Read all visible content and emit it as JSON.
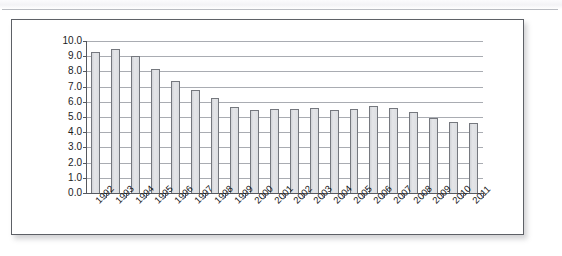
{
  "page": {
    "background_color": "#ffffff",
    "card_border_color": "#5d6066",
    "scan_band_color": "#f3f3f6"
  },
  "chart_style": {
    "bar_fill": "#dedfe3",
    "bar_border": "#75787e",
    "gridline_color": "#a9acb2",
    "axis_color": "#55585e",
    "text_color": "#17181a"
  },
  "chart_data": {
    "type": "bar",
    "title": "",
    "xlabel": "",
    "ylabel": "",
    "ylim": [
      0.0,
      10.0
    ],
    "ytick_step": 1.0,
    "ytick_labels": [
      "10.0",
      "9.0",
      "8.0",
      "7.0",
      "6.0",
      "5.0",
      "4.0",
      "3.0",
      "2.0",
      "1.0",
      "0.0"
    ],
    "ytick_values": [
      10.0,
      9.0,
      8.0,
      7.0,
      6.0,
      5.0,
      4.0,
      3.0,
      2.0,
      1.0,
      0.0
    ],
    "grid": true,
    "legend": false,
    "legend_position": "none",
    "categories": [
      "1992",
      "1993",
      "1994",
      "1995",
      "1996",
      "1997",
      "1998",
      "1999",
      "2000",
      "2001",
      "2002",
      "2003",
      "2004",
      "2005",
      "2006",
      "2007",
      "2008",
      "2009",
      "2010",
      "2011"
    ],
    "values": [
      9.3,
      9.5,
      9.0,
      8.15,
      7.4,
      6.8,
      6.25,
      5.65,
      5.45,
      5.55,
      5.55,
      5.6,
      5.45,
      5.5,
      5.75,
      5.6,
      5.3,
      4.95,
      4.7,
      4.6
    ],
    "series": [
      {
        "name": "",
        "values": [
          9.3,
          9.5,
          9.0,
          8.15,
          7.4,
          6.8,
          6.25,
          5.65,
          5.45,
          5.55,
          5.55,
          5.6,
          5.45,
          5.5,
          5.75,
          5.6,
          5.3,
          4.95,
          4.7,
          4.6
        ]
      }
    ]
  }
}
